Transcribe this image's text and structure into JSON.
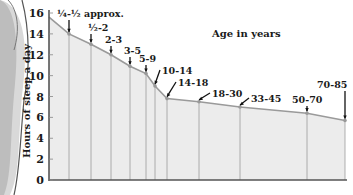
{
  "chart_data": {
    "type": "area",
    "title": "Age in years",
    "xlabel": "Age in years",
    "ylabel": "Hours of sleep a day",
    "ylim": [
      0,
      16
    ],
    "yticks": [
      0,
      2,
      4,
      6,
      8,
      10,
      12,
      14,
      16
    ],
    "grid": false,
    "legend": null,
    "categories": [
      "¼-½ approx.",
      "½-2",
      "2-3",
      "3-5",
      "5-9",
      "10-14",
      "14-18",
      "18-30",
      "33-45",
      "50-70",
      "70-85"
    ],
    "values": [
      14,
      13,
      12,
      10.9,
      10.2,
      9,
      7.8,
      7.5,
      7,
      6.4,
      5.7
    ],
    "start_value": 15.6,
    "annotations": [
      "¼-½ approx.",
      "½-2",
      "2-3",
      "3-5",
      "5-9",
      "10-14",
      "14-18",
      "18-30",
      "33-45",
      "50-70",
      "70-85"
    ]
  },
  "labels": {
    "title": "Age in years",
    "ylabel": "Hours of sleep a day",
    "yticks": [
      "0",
      "2",
      "4",
      "6",
      "8",
      "10",
      "12",
      "14",
      "16"
    ]
  },
  "colors": {
    "fill": "#ececec",
    "curve": "#9a9a9a",
    "axis": "#555555",
    "text": "#1a1a1a",
    "decor_ring": "#888888"
  }
}
